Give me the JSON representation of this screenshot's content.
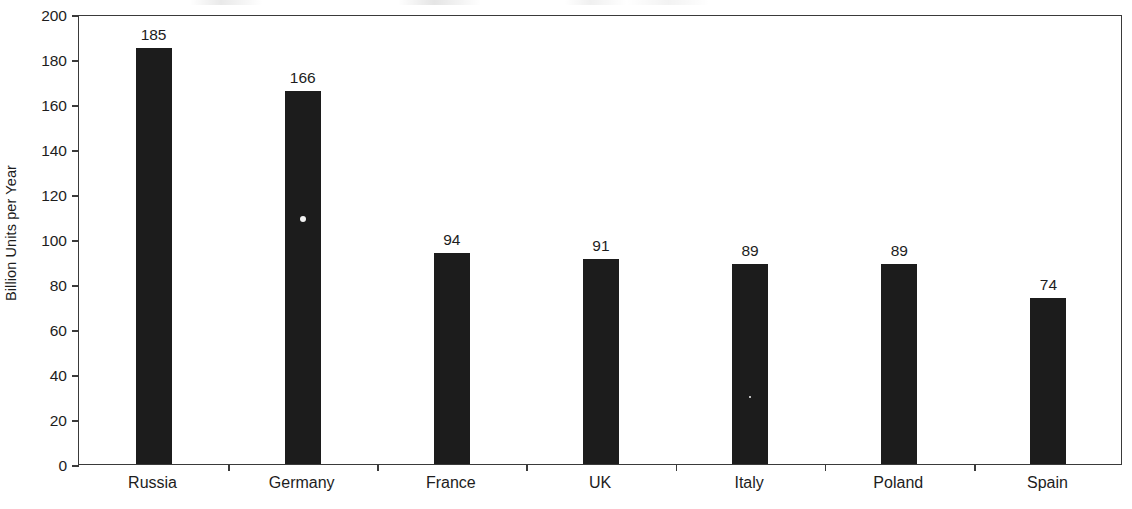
{
  "chart_data": {
    "type": "bar",
    "title": "",
    "xlabel": "",
    "ylabel": "Billion Units per Year",
    "categories": [
      "Russia",
      "Germany",
      "France",
      "UK",
      "Italy",
      "Poland",
      "Spain"
    ],
    "values": [
      185,
      166,
      94,
      91,
      89,
      89,
      74
    ],
    "value_labels": [
      "185",
      "166",
      "94",
      "91",
      "89",
      "89",
      "74"
    ],
    "ylim": [
      0,
      200
    ],
    "ytick_labels": [
      "0",
      "20",
      "40",
      "60",
      "80",
      "100",
      "120",
      "140",
      "160",
      "180",
      "200"
    ],
    "ytick_values": [
      0,
      20,
      40,
      60,
      80,
      100,
      120,
      140,
      160,
      180,
      200
    ],
    "grid": false,
    "legend": null,
    "bar_color": "#1c1c1c",
    "axis_color": "#3a3a3a",
    "background_color": "#ffffff"
  }
}
